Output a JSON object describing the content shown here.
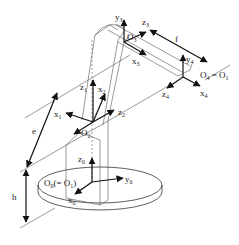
{
  "diagram": {
    "frames": [
      {
        "id": "frame-0",
        "origin": "O0(= O1)",
        "axes": [
          "x0",
          "y0",
          "z0"
        ]
      },
      {
        "id": "frame-1",
        "axes": [
          "x1",
          "z1"
        ]
      },
      {
        "id": "frame-2",
        "origin": "O2",
        "axes": [
          "x2",
          "z2"
        ]
      },
      {
        "id": "frame-3",
        "origin": "O3",
        "axes": [
          "x3",
          "y3",
          "z3"
        ]
      },
      {
        "id": "frame-4",
        "origin": "O4 = O1",
        "axes": [
          "x4",
          "y4",
          "z4"
        ]
      }
    ],
    "dimensions": [
      {
        "id": "h",
        "label": "h"
      },
      {
        "id": "e",
        "label": "e"
      },
      {
        "id": "f",
        "label": "f"
      }
    ],
    "labels": {
      "O0": "O",
      "O0_sub": "0",
      "O0_rest": "(= O",
      "O0_rest_sub": "1",
      "O0_close": ")",
      "O2": "O",
      "O2_sub": "2",
      "O3": "O",
      "O3_sub": "3",
      "O4": "O",
      "O4_sub": "4",
      "O4_eq": " = O",
      "O4_eq_sub": "1",
      "x": "x",
      "y": "y",
      "z": "z",
      "s0": "0",
      "s1": "1",
      "s2": "2",
      "s3": "3",
      "s4": "4",
      "h": "h",
      "e": "e",
      "f": "f"
    }
  }
}
